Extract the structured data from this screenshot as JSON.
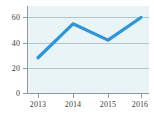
{
  "chart_data": {
    "type": "line",
    "title": "",
    "xlabel": "",
    "ylabel": "",
    "categories": [
      "2013",
      "2014",
      "2015",
      "2016"
    ],
    "values": [
      28,
      55,
      42,
      60
    ],
    "series": [
      {
        "name": "series-1",
        "values": [
          28,
          55,
          42,
          60
        ]
      }
    ],
    "ylim": [
      0,
      65
    ],
    "yticks": [
      0,
      20,
      40,
      60
    ],
    "ytick_labels": [
      "0",
      "20",
      "40",
      "60"
    ],
    "xtick_labels": [
      "2013",
      "2014",
      "2015",
      "2016"
    ],
    "grid": true,
    "legend": false,
    "colors": {
      "line": "#2e96d8",
      "plot_background": "#e9f4f7",
      "canvas_background": "#ffffff",
      "gridline": "#9fb6bd",
      "axis": "#8d9ba1",
      "tick_text": "#3c3c3c"
    }
  }
}
